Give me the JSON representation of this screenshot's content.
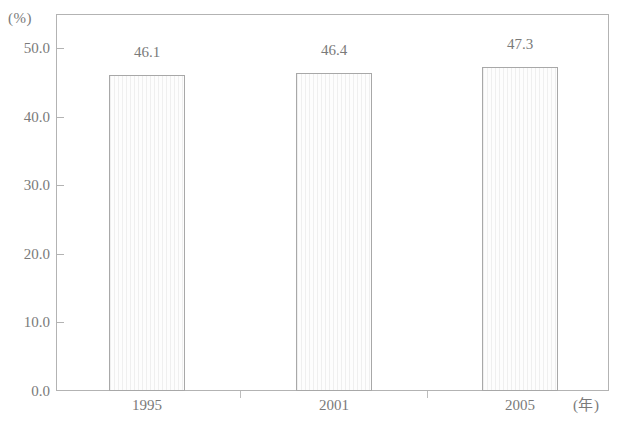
{
  "chart_data": {
    "type": "bar",
    "title": "",
    "subtitle": "",
    "xlabel": "(年)",
    "ylabel": "(%)",
    "categories": [
      "1995",
      "2001",
      "2005"
    ],
    "values": [
      46.1,
      46.4,
      47.3
    ],
    "data_labels": [
      "46.1",
      "46.4",
      "47.3"
    ],
    "series": [
      {
        "name": "",
        "values": [
          46.1,
          46.4,
          47.3
        ]
      }
    ],
    "ylim": [
      0.0,
      55.0
    ],
    "yticks": [
      0.0,
      10.0,
      20.0,
      30.0,
      40.0,
      50.0
    ],
    "ytick_labels": [
      "0.0",
      "10.0",
      "20.0",
      "30.0",
      "40.0",
      "50.0"
    ],
    "grid": false,
    "legend": false,
    "legend_position": "none",
    "annotations": []
  },
  "axes": {
    "y_unit_label": "(%)",
    "x_unit_label": "(年)"
  },
  "colors": {
    "frame": "#b3b3b3",
    "bar_outline": "#a8a8a8",
    "bar_fill": "#fbfbfb",
    "bar_hatch": "#efefef",
    "text": "#7a7a7a"
  }
}
